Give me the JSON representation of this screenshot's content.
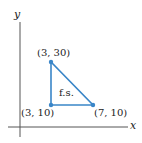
{
  "figure": {
    "axes": {
      "x_label": "x",
      "y_label": "y"
    },
    "region_label": "f.s.",
    "vertices": [
      {
        "label": "(3, 30)",
        "x": 3,
        "y": 30
      },
      {
        "label": "(3, 10)",
        "x": 3,
        "y": 10
      },
      {
        "label": "(7, 10)",
        "x": 7,
        "y": 10
      }
    ],
    "colors": {
      "region_edge": "#3a86c8",
      "axis": "#555555"
    }
  }
}
